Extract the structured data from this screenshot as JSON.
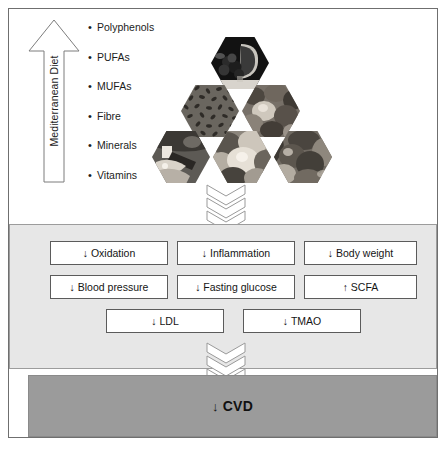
{
  "figure": {
    "colors": {
      "frame_border": "#6f6f6f",
      "diet_panel_bg": "#ffffff",
      "effects_panel_bg": "#e7e7e7",
      "effects_panel_border": "#9c9c9c",
      "box_bg": "#ffffff",
      "box_border": "#5b5b5b",
      "cvd_panel_bg": "#9b9b9b",
      "chevron_fill": "#ffffff",
      "chevron_stroke": "#9a9a9a",
      "text": "#151515"
    }
  },
  "diet": {
    "arrow_label": "Mediterranean Diet",
    "nutrients": [
      {
        "bullet": "•",
        "label": "Polyphenols"
      },
      {
        "bullet": "•",
        "label": "PUFAs"
      },
      {
        "bullet": "•",
        "label": "MUFAs"
      },
      {
        "bullet": "•",
        "label": "Fibre"
      },
      {
        "bullet": "•",
        "label": "Minerals"
      },
      {
        "bullet": "•",
        "label": "Vitamins"
      }
    ],
    "food_hexagons": [
      {
        "name": "red-wine-grapes",
        "row": 0
      },
      {
        "name": "legumes-grains",
        "row": 1
      },
      {
        "name": "nuts-olives",
        "row": 1
      },
      {
        "name": "fish-seafood",
        "row": 2
      },
      {
        "name": "fruits",
        "row": 2
      },
      {
        "name": "vegetables",
        "row": 2
      }
    ]
  },
  "effects": {
    "rows": [
      [
        {
          "arrow": "↓",
          "label": "Oxidation"
        },
        {
          "arrow": "↓",
          "label": "Inflammation"
        },
        {
          "arrow": "↓",
          "label": "Body weight"
        }
      ],
      [
        {
          "arrow": "↓",
          "label": "Blood pressure"
        },
        {
          "arrow": "↓",
          "label": "Fasting glucose"
        },
        {
          "arrow": "↑",
          "label": "SCFA"
        }
      ],
      [
        {
          "arrow": "↓",
          "label": "LDL"
        },
        {
          "arrow": "↓",
          "label": "TMAO"
        }
      ]
    ]
  },
  "outcome": {
    "arrow": "↓",
    "label": "CVD"
  }
}
